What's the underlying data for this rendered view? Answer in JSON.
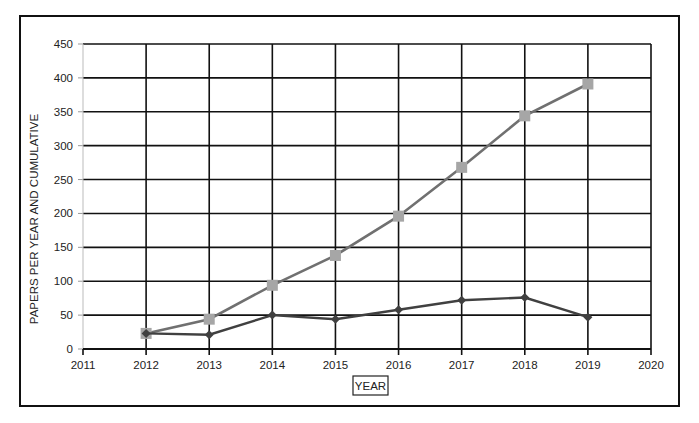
{
  "chart_data": {
    "type": "line",
    "title": "",
    "xlabel": "YEAR",
    "ylabel": "PAPERS PER YEAR AND CUMULATIVE",
    "x": [
      2012,
      2013,
      2014,
      2015,
      2016,
      2017,
      2018,
      2019
    ],
    "xlim": [
      2011,
      2020
    ],
    "xticks": [
      2011,
      2012,
      2013,
      2014,
      2015,
      2016,
      2017,
      2018,
      2019,
      2020
    ],
    "ylim": [
      0,
      450
    ],
    "yticks": [
      0,
      50,
      100,
      150,
      200,
      250,
      300,
      350,
      400,
      450
    ],
    "grid": true,
    "legend": null,
    "series": [
      {
        "name": "Papers per year",
        "marker": "diamond",
        "color": "#404040",
        "values": [
          23,
          21,
          50,
          44,
          58,
          72,
          76,
          47
        ]
      },
      {
        "name": "Cumulative papers",
        "marker": "square",
        "color": "#707070",
        "marker_color": "#a6a6a6",
        "values": [
          23,
          44,
          94,
          138,
          196,
          268,
          344,
          391
        ]
      }
    ]
  },
  "colors": {
    "grid": "#111111",
    "frame": "#111111",
    "background": "#ffffff"
  }
}
